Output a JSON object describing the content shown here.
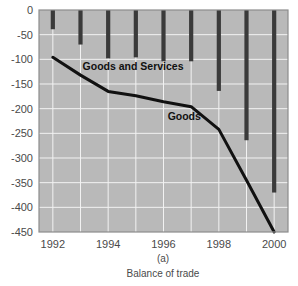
{
  "chart_data": {
    "type": "bar",
    "title": "",
    "subtitle": "",
    "caption_panel": "(a)",
    "caption_text": "Balance of trade",
    "xlabel": "",
    "ylabel": "",
    "ylim": [
      -450,
      0
    ],
    "ytick_step": 50,
    "yticks": [
      0,
      -50,
      -100,
      -150,
      -200,
      -250,
      -300,
      -350,
      -400,
      -450
    ],
    "ytick_labels": [
      "0",
      "-50",
      "-100",
      "-150",
      "-200",
      "-250",
      "-300",
      "-350",
      "-400",
      "-450"
    ],
    "xlim": [
      1991.5,
      2000.5
    ],
    "xticks": [
      1992,
      1994,
      1996,
      1998,
      2000
    ],
    "xtick_labels": [
      "1992",
      "1994",
      "1996",
      "1998",
      "2000"
    ],
    "x": [
      1992,
      1993,
      1994,
      1995,
      1996,
      1997,
      1998,
      1999,
      2000
    ],
    "grid": true,
    "legend_position": "inline-annotations",
    "series": [
      {
        "name": "Goods and Services",
        "type": "bar",
        "label_text": "Goods and Services",
        "label_x": 1994.9,
        "label_y": -122,
        "color": "#3a3a3a",
        "values": [
          -39,
          -70,
          -98,
          -96,
          -104,
          -104,
          -164,
          -264,
          -370
        ]
      },
      {
        "name": "Goods",
        "type": "line",
        "label_text": "Goods",
        "label_x": 1996.75,
        "label_y": -222,
        "color": "#111111",
        "values": [
          -96,
          -132,
          -165,
          -174,
          -186,
          -196,
          -242,
          -345,
          -450
        ]
      }
    ],
    "annotations": [
      {
        "text": "Goods and Services",
        "x": 1994.9,
        "y": -122
      },
      {
        "text": "Goods",
        "x": 1996.75,
        "y": -222
      }
    ],
    "panel_background": "#b9b9b9",
    "gridline_color": "#f2f2f2",
    "axis_text_color": "#4a4a4a"
  }
}
